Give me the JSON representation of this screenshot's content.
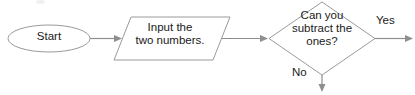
{
  "diagram": {
    "type": "flowchart",
    "nodes": [
      {
        "id": "start",
        "shape": "ellipse",
        "label": "Start"
      },
      {
        "id": "input",
        "shape": "parallelogram",
        "label": "Input the\ntwo numbers."
      },
      {
        "id": "decision",
        "shape": "diamond",
        "label": "Can you\nsubtract the\nones?"
      }
    ],
    "edges": [
      {
        "id": "start-to-input",
        "from": "start",
        "to": "input",
        "label": "",
        "direction": "right"
      },
      {
        "id": "input-to-decision",
        "from": "input",
        "to": "decision",
        "label": "",
        "direction": "right"
      },
      {
        "id": "decision-yes",
        "from": "decision",
        "to": "",
        "label": "Yes",
        "direction": "right"
      },
      {
        "id": "decision-no",
        "from": "decision",
        "to": "",
        "label": "No",
        "direction": "down"
      }
    ],
    "colors": {
      "background": "#ffffff",
      "shape_stroke": "#9a9a9a",
      "connector": "#8e8e8e",
      "text": "#1a1a1a"
    }
  }
}
